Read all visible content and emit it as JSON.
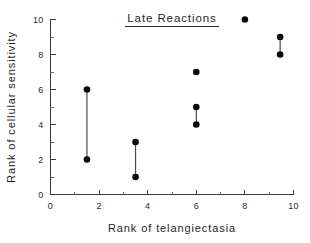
{
  "chart_data": {
    "type": "scatter",
    "title": "Late Reactions",
    "xlabel": "Rank of telangiectasia",
    "ylabel": "Rank of cellular sensitivity",
    "xlim": [
      0,
      10
    ],
    "ylim": [
      0,
      10
    ],
    "x_ticks": [
      0,
      2,
      4,
      6,
      8,
      10
    ],
    "y_ticks": [
      0,
      2,
      4,
      6,
      8,
      10
    ],
    "x_tick_labels": [
      "0",
      "2",
      "4",
      "6",
      "8",
      "10"
    ],
    "y_tick_labels": [
      "0",
      "2",
      "4",
      "6",
      "8",
      "10"
    ],
    "x_minor_tick_step": 1,
    "y_minor_tick_step": 1,
    "grid": false,
    "legend": "none",
    "title_underlined": true,
    "marker_color": "#080808",
    "connector_color": "#4a4a4a",
    "axis_color": "#3a3a3a",
    "background_color": "#ffffff",
    "points": [
      {
        "x": 1.5,
        "y": 6
      },
      {
        "x": 1.5,
        "y": 2
      },
      {
        "x": 3.5,
        "y": 3
      },
      {
        "x": 3.5,
        "y": 1
      },
      {
        "x": 6.0,
        "y": 7
      },
      {
        "x": 6.0,
        "y": 5
      },
      {
        "x": 6.0,
        "y": 4
      },
      {
        "x": 8.0,
        "y": 10
      },
      {
        "x": 9.45,
        "y": 9
      },
      {
        "x": 9.45,
        "y": 8
      }
    ],
    "connectors": [
      {
        "x": 1.5,
        "y_low": 2,
        "y_high": 6
      },
      {
        "x": 3.5,
        "y_low": 1,
        "y_high": 3
      },
      {
        "x": 6.0,
        "y_low": 4,
        "y_high": 5
      },
      {
        "x": 9.45,
        "y_low": 8,
        "y_high": 9
      }
    ]
  }
}
